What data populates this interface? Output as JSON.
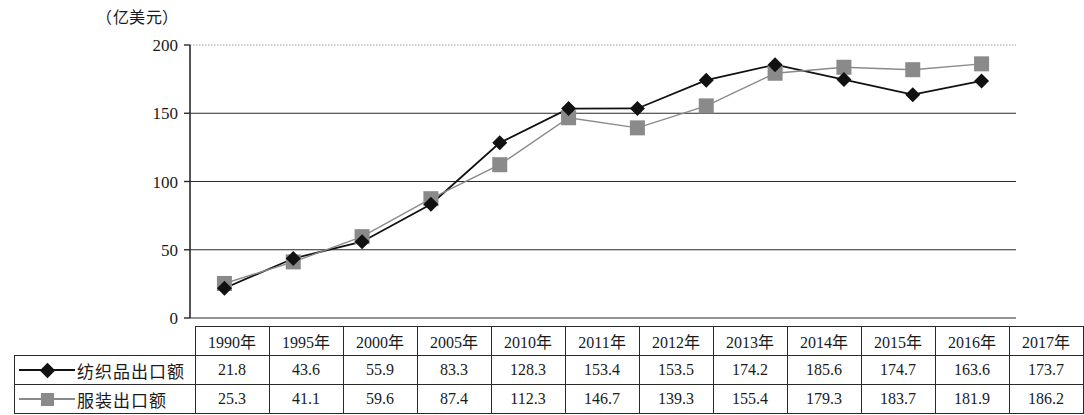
{
  "chart_data": {
    "type": "line",
    "title": "",
    "ylabel": "（亿美元）",
    "xlabel": "",
    "ylim": [
      0,
      200
    ],
    "yticks": [
      0,
      50,
      100,
      150,
      200
    ],
    "grid": true,
    "legend_position": "table-row-labels",
    "categories": [
      "1990年",
      "1995年",
      "2000年",
      "2005年",
      "2010年",
      "2011年",
      "2012年",
      "2013年",
      "2014年",
      "2015年",
      "2016年",
      "2017年"
    ],
    "series": [
      {
        "name": "纺织品出口额",
        "marker": "diamond",
        "color": "#111111",
        "values": [
          21.8,
          43.6,
          55.9,
          83.3,
          128.3,
          153.4,
          153.5,
          174.2,
          185.6,
          174.7,
          163.6,
          173.7
        ]
      },
      {
        "name": "服装出口额",
        "marker": "square",
        "color": "#8a8a8a",
        "values": [
          25.3,
          41.1,
          59.6,
          87.4,
          112.3,
          146.7,
          139.3,
          155.4,
          179.3,
          183.7,
          181.9,
          186.2
        ]
      }
    ]
  },
  "axis": {
    "unit_caption": "（亿美元）",
    "tick_labels": [
      "200",
      "150",
      "100",
      "50",
      "0"
    ]
  },
  "table": {
    "year_headers": [
      "1990年",
      "1995年",
      "2000年",
      "2005年",
      "2010年",
      "2011年",
      "2012年",
      "2013年",
      "2014年",
      "2015年",
      "2016年",
      "2017年"
    ],
    "rows": [
      {
        "label": "纺织品出口额",
        "marker": "diamond-marker-icon",
        "values": [
          "21.8",
          "43.6",
          "55.9",
          "83.3",
          "128.3",
          "153.4",
          "153.5",
          "174.2",
          "185.6",
          "174.7",
          "163.6",
          "173.7"
        ]
      },
      {
        "label": "服装出口额",
        "marker": "square-marker-icon",
        "values": [
          "25.3",
          "41.1",
          "59.6",
          "87.4",
          "112.3",
          "146.7",
          "139.3",
          "155.4",
          "179.3",
          "183.7",
          "181.9",
          "186.2"
        ]
      }
    ]
  }
}
